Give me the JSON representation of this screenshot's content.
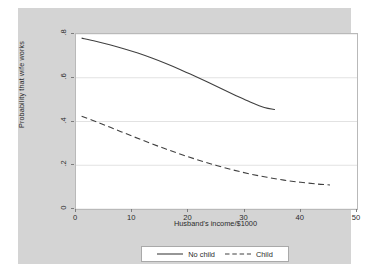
{
  "chart_data": {
    "type": "line",
    "title": "",
    "subtitle": "",
    "xlabel": "Husband's income/$1000",
    "ylabel": "Probability that wife works",
    "xlim": [
      0,
      50
    ],
    "ylim": [
      0,
      0.8
    ],
    "xticks": [
      "0",
      "10",
      "20",
      "30",
      "40",
      "50"
    ],
    "xtick_values": [
      0,
      10,
      20,
      30,
      40,
      50
    ],
    "yticks": [
      "0",
      ".2",
      ".4",
      ".6",
      ".8"
    ],
    "ytick_values": [
      0,
      0.2,
      0.4,
      0.6,
      0.8
    ],
    "grid": "horizontal",
    "legend_position": "bottom",
    "background_color": "#d4d4d4",
    "plot_background_color": "#ffffff",
    "line_color": "#404040",
    "series": [
      {
        "name": "No child",
        "style": "solid",
        "x": [
          1.0,
          3.5,
          6.0,
          8.5,
          11.0,
          13.5,
          16.0,
          18.5,
          21.0,
          23.5,
          26.0,
          28.5,
          31.0,
          33.5,
          35.4
        ],
        "values": [
          0.781,
          0.767,
          0.751,
          0.733,
          0.713,
          0.69,
          0.665,
          0.638,
          0.609,
          0.579,
          0.548,
          0.518,
          0.489,
          0.464,
          0.455
        ]
      },
      {
        "name": "Child",
        "style": "dashed",
        "x": [
          1.0,
          4.0,
          7.0,
          10.0,
          13.0,
          16.0,
          19.0,
          22.0,
          25.0,
          28.0,
          31.0,
          34.0,
          37.0,
          40.0,
          43.0,
          45.2
        ],
        "values": [
          0.424,
          0.395,
          0.364,
          0.333,
          0.303,
          0.274,
          0.247,
          0.222,
          0.199,
          0.178,
          0.16,
          0.145,
          0.132,
          0.122,
          0.114,
          0.11
        ]
      }
    ]
  },
  "legend": {
    "entries": [
      {
        "label": "No child",
        "style": "solid"
      },
      {
        "label": "Child",
        "style": "dashed"
      }
    ]
  }
}
